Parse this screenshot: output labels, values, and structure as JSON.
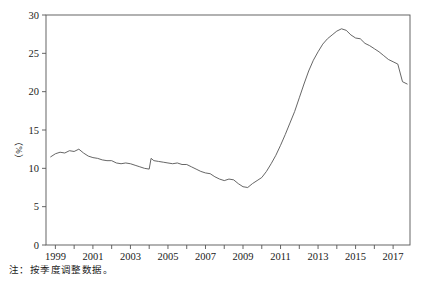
{
  "chart_data": {
    "type": "line",
    "title": "",
    "xlabel": "",
    "ylabel": "（%）",
    "xlim": [
      1998.5,
      2017.9
    ],
    "ylim": [
      0,
      30
    ],
    "grid": false,
    "legend": null,
    "y_ticks": [
      0,
      5,
      10,
      15,
      20,
      25,
      30
    ],
    "y_tick_labels": [
      "0",
      "5",
      "10",
      "15",
      "20",
      "25",
      "30"
    ],
    "x_ticks": [
      1999,
      2000,
      2001,
      2002,
      2003,
      2004,
      2005,
      2006,
      2007,
      2008,
      2009,
      2010,
      2011,
      2012,
      2013,
      2014,
      2015,
      2016,
      2017
    ],
    "x_tick_labels": [
      "1999",
      "",
      "2001",
      "",
      "2003",
      "",
      "2005",
      "",
      "2007",
      "",
      "2009",
      "",
      "2011",
      "",
      "2013",
      "",
      "2015",
      "",
      "2017"
    ],
    "line_color": "#555555",
    "line_width": 0.9,
    "series": [
      {
        "name": "ratio",
        "x": [
          1998.75,
          1999.0,
          1999.25,
          1999.5,
          1999.75,
          2000.0,
          2000.25,
          2000.5,
          2000.75,
          2001.0,
          2001.25,
          2001.5,
          2001.75,
          2002.0,
          2002.25,
          2002.5,
          2002.75,
          2003.0,
          2003.25,
          2003.5,
          2003.75,
          2004.0,
          2004.1,
          2004.25,
          2004.5,
          2004.75,
          2005.0,
          2005.25,
          2005.5,
          2005.75,
          2006.0,
          2006.25,
          2006.5,
          2006.75,
          2007.0,
          2007.25,
          2007.5,
          2007.75,
          2008.0,
          2008.25,
          2008.5,
          2008.75,
          2009.0,
          2009.25,
          2009.5,
          2009.75,
          2010.0,
          2010.25,
          2010.5,
          2010.75,
          2011.0,
          2011.25,
          2011.5,
          2011.75,
          2012.0,
          2012.25,
          2012.5,
          2012.75,
          2013.0,
          2013.25,
          2013.5,
          2013.75,
          2014.0,
          2014.25,
          2014.5,
          2014.75,
          2015.0,
          2015.25,
          2015.5,
          2015.75,
          2016.0,
          2016.25,
          2016.5,
          2016.75,
          2017.0,
          2017.25,
          2017.5,
          2017.75
        ],
        "values": [
          11.5,
          11.9,
          12.1,
          12.0,
          12.3,
          12.2,
          12.5,
          12.0,
          11.6,
          11.4,
          11.3,
          11.1,
          11.0,
          11.0,
          10.7,
          10.6,
          10.7,
          10.6,
          10.4,
          10.2,
          10.0,
          9.9,
          11.3,
          11.0,
          10.9,
          10.8,
          10.7,
          10.6,
          10.7,
          10.5,
          10.5,
          10.2,
          9.9,
          9.6,
          9.4,
          9.3,
          8.9,
          8.6,
          8.4,
          8.6,
          8.5,
          8.0,
          7.6,
          7.5,
          8.0,
          8.4,
          8.8,
          9.6,
          10.6,
          11.7,
          13.0,
          14.4,
          15.9,
          17.4,
          19.2,
          21.0,
          22.7,
          24.1,
          25.2,
          26.2,
          26.9,
          27.4,
          27.9,
          28.2,
          28.0,
          27.4,
          27.0,
          26.9,
          26.3,
          26.0,
          25.6,
          25.2,
          24.7,
          24.2,
          23.9,
          23.6,
          21.3,
          21.0
        ]
      }
    ]
  },
  "axis": {
    "y_label": "（%）"
  },
  "footnote": {
    "text": "注：按季度调整数据。"
  }
}
